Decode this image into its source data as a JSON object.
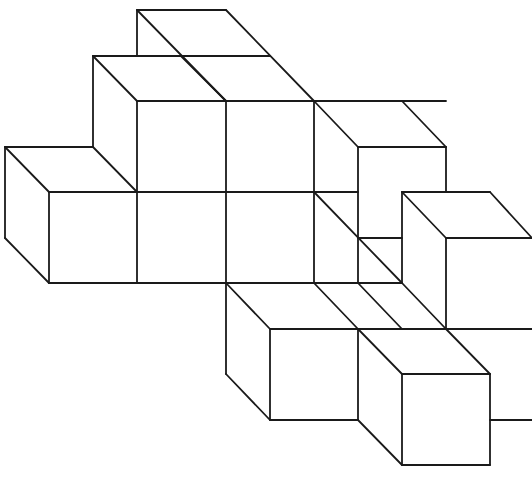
{
  "diagram": {
    "type": "isometric-cube-stack",
    "stroke_color": "#1a1a1a",
    "background": "#ffffff",
    "stroke_width": 1.8,
    "cube_size": 88,
    "depth_offset": {
      "dx": 44,
      "dy": 46
    },
    "segments": [
      [
        137,
        10,
        226,
        10
      ],
      [
        137,
        10,
        137,
        56
      ],
      [
        137,
        10,
        226,
        101
      ],
      [
        226,
        10,
        314,
        101
      ],
      [
        93,
        56,
        270,
        56
      ],
      [
        93,
        56,
        93,
        147
      ],
      [
        93,
        56,
        137,
        101
      ],
      [
        181,
        56,
        226,
        101
      ],
      [
        137,
        101,
        446,
        101
      ],
      [
        314,
        101,
        358,
        147
      ],
      [
        402,
        101,
        446,
        147
      ],
      [
        137,
        101,
        137,
        283
      ],
      [
        226,
        101,
        226,
        283
      ],
      [
        314,
        101,
        314,
        192
      ],
      [
        358,
        147,
        446,
        147
      ],
      [
        358,
        147,
        358,
        283
      ],
      [
        446,
        147,
        446,
        192
      ],
      [
        5,
        147,
        93,
        147
      ],
      [
        5,
        147,
        5,
        238
      ],
      [
        5,
        147,
        49,
        192
      ],
      [
        93,
        147,
        137,
        192
      ],
      [
        5,
        238,
        49,
        283
      ],
      [
        49,
        192,
        358,
        192
      ],
      [
        49,
        192,
        49,
        283
      ],
      [
        314,
        192,
        402,
        283
      ],
      [
        314,
        192,
        314,
        283
      ],
      [
        358,
        238,
        402,
        238
      ],
      [
        402,
        192,
        490,
        192
      ],
      [
        402,
        192,
        402,
        283
      ],
      [
        402,
        192,
        446,
        238
      ],
      [
        490,
        192,
        532,
        238
      ],
      [
        446,
        238,
        532,
        238
      ],
      [
        446,
        238,
        446,
        329
      ],
      [
        49,
        283,
        402,
        283
      ],
      [
        226,
        283,
        226,
        374
      ],
      [
        226,
        283,
        270,
        329
      ],
      [
        314,
        283,
        358,
        329
      ],
      [
        402,
        283,
        446,
        329
      ],
      [
        358,
        283,
        402,
        329
      ],
      [
        270,
        329,
        532,
        329
      ],
      [
        270,
        329,
        270,
        420
      ],
      [
        358,
        329,
        358,
        420
      ],
      [
        358,
        329,
        402,
        374
      ],
      [
        446,
        329,
        490,
        374
      ],
      [
        226,
        374,
        270,
        420
      ],
      [
        270,
        420,
        358,
        420
      ],
      [
        402,
        374,
        490,
        374
      ],
      [
        402,
        374,
        402,
        465
      ],
      [
        490,
        374,
        490,
        465
      ],
      [
        490,
        420,
        532,
        420
      ],
      [
        358,
        420,
        402,
        465
      ],
      [
        402,
        465,
        490,
        465
      ]
    ]
  }
}
